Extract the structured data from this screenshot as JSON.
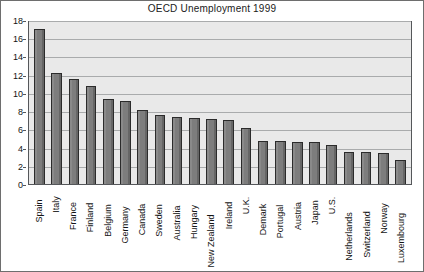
{
  "chart_data": {
    "type": "bar",
    "title": "OECD Unemployment 1999",
    "xlabel": "",
    "ylabel": "",
    "ylim": [
      0,
      18
    ],
    "ytick_step": 2,
    "yticks": [
      0,
      2,
      4,
      6,
      8,
      10,
      12,
      14,
      16,
      18
    ],
    "grid": true,
    "legend": "none",
    "categories": [
      "Spain",
      "Italy",
      "France",
      "Finland",
      "Belgium",
      "Germany",
      "Canada",
      "Sweden",
      "Australia",
      "Hungary",
      "New Zealand",
      "Ireland",
      "U.K.",
      "Demark",
      "Portugal",
      "Austria",
      "Japan",
      "U.S.",
      "Netherlands",
      "Switzerland",
      "Norway",
      "Luxembourg"
    ],
    "values": [
      17.0,
      12.2,
      11.5,
      10.8,
      9.3,
      9.1,
      8.1,
      7.6,
      7.4,
      7.3,
      7.1,
      7.0,
      6.2,
      4.7,
      4.7,
      4.6,
      4.6,
      4.3,
      3.5,
      3.5,
      3.4,
      2.6
    ],
    "series": [
      {
        "name": "Unemployment rate",
        "values": [
          17.0,
          12.2,
          11.5,
          10.8,
          9.3,
          9.1,
          8.1,
          7.6,
          7.4,
          7.3,
          7.1,
          7.0,
          6.2,
          4.7,
          4.7,
          4.6,
          4.6,
          4.3,
          3.5,
          3.5,
          3.4,
          2.6
        ]
      }
    ]
  },
  "colors": {
    "bar_fill": "#7d7d7d",
    "bar_border": "#2b2b2b",
    "plot_background": "#e9e9e9",
    "gridline": "#a9abac",
    "axis_line": "#55575a",
    "figure_border": "#6e6e6e",
    "text": "#141414",
    "figure_background": "#ffffff"
  }
}
